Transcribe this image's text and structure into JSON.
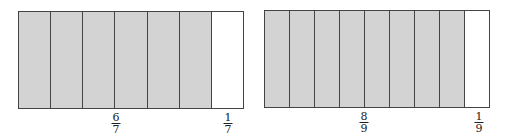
{
  "diagrams": [
    {
      "total_parts": 7,
      "shaded_parts": 6,
      "labels": {
        "shaded": {
          "num": "6",
          "den": "7"
        },
        "unshaded": {
          "num": "1",
          "den": "7"
        }
      }
    },
    {
      "total_parts": 9,
      "shaded_parts": 8,
      "labels": {
        "shaded": {
          "num": "8",
          "den": "9"
        },
        "unshaded": {
          "num": "1",
          "den": "9"
        }
      }
    }
  ],
  "colors": {
    "shaded": "#d3d3d3",
    "unshaded": "#ffffff",
    "border": "#444444"
  }
}
